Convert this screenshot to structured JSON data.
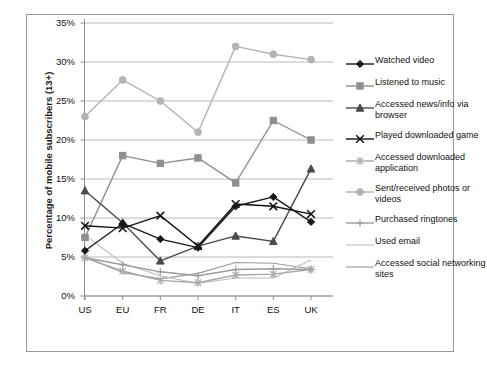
{
  "top_cut_text": "",
  "chart_data": {
    "type": "line",
    "title": "",
    "xlabel": "",
    "ylabel": "Percentage of mobile subscribers (13+)",
    "categories": [
      "US",
      "EU",
      "FR",
      "DE",
      "IT",
      "ES",
      "UK"
    ],
    "ytick_labels": [
      "0%",
      "5%",
      "10%",
      "15%",
      "20%",
      "25%",
      "30%",
      "35%"
    ],
    "ytick_values": [
      0,
      5,
      10,
      15,
      20,
      25,
      30,
      35
    ],
    "ylim": [
      0,
      35
    ],
    "grid": true,
    "legend_position": "right",
    "series": [
      {
        "name": "Watched video",
        "marker": "diamond",
        "color": "#1a1a1a",
        "values": [
          5.8,
          9.3,
          7.3,
          6.2,
          11.5,
          12.7,
          9.5
        ]
      },
      {
        "name": "Listened to music",
        "marker": "square",
        "color": "#8f8f8f",
        "values": [
          7.5,
          18.0,
          17.0,
          17.7,
          14.5,
          22.5,
          20.0
        ]
      },
      {
        "name": "Accessed news/info via browser",
        "marker": "triangle",
        "color": "#4a4a4a",
        "values": [
          13.5,
          9.4,
          4.5,
          6.4,
          7.7,
          7.0,
          16.3
        ]
      },
      {
        "name": "Played downloaded game",
        "marker": "x-cross",
        "color": "#111111",
        "values": [
          9.0,
          8.7,
          10.3,
          6.4,
          11.8,
          11.5,
          10.5
        ]
      },
      {
        "name": "Accessed downloaded application",
        "marker": "asterisk",
        "color": "#a8a8a8",
        "values": [
          4.9,
          3.2,
          2.0,
          1.7,
          2.7,
          2.8,
          3.4
        ]
      },
      {
        "name": "Sent/received photos or videos",
        "marker": "circle",
        "color": "#b3b3b3",
        "values": [
          23.0,
          27.7,
          25.0,
          21.0,
          32.0,
          31.0,
          30.3
        ]
      },
      {
        "name": "Purchased ringtones",
        "marker": "plus",
        "color": "#9c9c9c",
        "values": [
          4.9,
          4.0,
          3.1,
          2.6,
          3.4,
          3.5,
          3.4
        ]
      },
      {
        "name": "Used email",
        "marker": "none",
        "color": "#bdbdbd",
        "values": [
          7.8,
          4.2,
          2.6,
          1.6,
          2.3,
          2.3,
          4.6
        ]
      },
      {
        "name": "Accessed social networking sites",
        "marker": "none",
        "color": "#9a9a9a",
        "values": [
          5.0,
          3.0,
          2.2,
          2.9,
          4.3,
          4.2,
          3.5
        ]
      }
    ]
  }
}
